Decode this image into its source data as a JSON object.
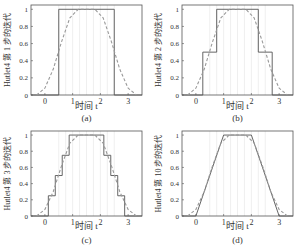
{
  "figure": {
    "background": "#ffffff",
    "axes_color": "#555555",
    "step_color": "#555555",
    "target_color": "#999999",
    "grid_color": "#e4e4e4"
  },
  "chart_data": [
    {
      "type": "line",
      "panel_label": "(a)",
      "xlabel": "时间 t",
      "ylabel": "Hutlet4 第 1 步的迭代",
      "xlim": [
        -0.5,
        3.5
      ],
      "ylim": [
        0,
        1.05
      ],
      "xticks": [
        0,
        1,
        2,
        3
      ],
      "yticks": [
        0,
        0.2,
        0.4,
        0.6,
        0.8,
        1
      ],
      "ytick_labels": [
        "0",
        "0.2",
        "0.4",
        "0.6",
        "0.8",
        "1"
      ],
      "series": [
        {
          "name": "Hutlet4 iteration",
          "style": "solid",
          "x": [
            -0.5,
            0.5,
            0.5,
            2.5,
            2.5,
            3.5
          ],
          "y": [
            0,
            0,
            1,
            1,
            0,
            0
          ]
        },
        {
          "name": "limit function",
          "style": "dashed",
          "x": [
            -0.3,
            0,
            0.3,
            0.6,
            0.9,
            1.2,
            1.5,
            1.8,
            2.1,
            2.4,
            2.7,
            3.0,
            3.3
          ],
          "y": [
            0,
            0.08,
            0.3,
            0.62,
            0.9,
            1.0,
            1.0,
            1.0,
            0.9,
            0.62,
            0.3,
            0.08,
            0
          ]
        }
      ]
    },
    {
      "type": "line",
      "panel_label": "(b)",
      "xlabel": "时间 t",
      "ylabel": "Hutlet4 第 2 步的迭代",
      "xlim": [
        -0.5,
        3.5
      ],
      "ylim": [
        0,
        1.05
      ],
      "xticks": [
        0,
        1,
        2,
        3
      ],
      "yticks": [
        0,
        0.2,
        0.4,
        0.6,
        0.8,
        1
      ],
      "ytick_labels": [
        "0",
        "0.2",
        "0.4",
        "0.6",
        "0.8",
        "1"
      ],
      "series": [
        {
          "name": "Hutlet4 iteration",
          "style": "solid",
          "x": [
            -0.5,
            0.25,
            0.25,
            0.75,
            0.75,
            2.25,
            2.25,
            2.75,
            2.75,
            3.5
          ],
          "y": [
            0,
            0,
            0.5,
            0.5,
            1,
            1,
            0.5,
            0.5,
            0,
            0
          ]
        },
        {
          "name": "limit function",
          "style": "dashed",
          "x": [
            -0.3,
            0,
            0.3,
            0.6,
            0.9,
            1.2,
            1.5,
            1.8,
            2.1,
            2.4,
            2.7,
            3.0,
            3.3
          ],
          "y": [
            0,
            0.08,
            0.3,
            0.62,
            0.9,
            1.0,
            1.0,
            1.0,
            0.9,
            0.62,
            0.3,
            0.08,
            0
          ]
        }
      ]
    },
    {
      "type": "line",
      "panel_label": "(c)",
      "xlabel": "时间 t",
      "ylabel": "Hutlet4 第 3 步的迭代",
      "xlim": [
        -0.5,
        3.5
      ],
      "ylim": [
        0,
        1.05
      ],
      "xticks": [
        0,
        1,
        2,
        3
      ],
      "yticks": [
        0,
        0.2,
        0.4,
        0.6,
        0.8,
        1
      ],
      "ytick_labels": [
        "0",
        "0.2",
        "0.4",
        "0.6",
        "0.8",
        "1"
      ],
      "series": [
        {
          "name": "Hutlet4 iteration",
          "style": "solid",
          "x": [
            -0.5,
            0.125,
            0.125,
            0.375,
            0.375,
            0.625,
            0.625,
            0.875,
            0.875,
            2.125,
            2.125,
            2.375,
            2.375,
            2.625,
            2.625,
            2.875,
            2.875,
            3.5
          ],
          "y": [
            0,
            0,
            0.25,
            0.25,
            0.5,
            0.5,
            0.75,
            0.75,
            1,
            1,
            0.75,
            0.75,
            0.5,
            0.5,
            0.25,
            0.25,
            0,
            0
          ]
        },
        {
          "name": "limit function",
          "style": "dashed",
          "x": [
            -0.3,
            0,
            0.3,
            0.6,
            0.9,
            1.2,
            1.5,
            1.8,
            2.1,
            2.4,
            2.7,
            3.0,
            3.3
          ],
          "y": [
            0,
            0.08,
            0.3,
            0.62,
            0.9,
            1.0,
            1.0,
            1.0,
            0.9,
            0.62,
            0.3,
            0.08,
            0
          ]
        }
      ]
    },
    {
      "type": "line",
      "panel_label": "(d)",
      "xlabel": "时间 t",
      "ylabel": "Hutlet4 第 10 步的迭代",
      "xlim": [
        -0.5,
        3.5
      ],
      "ylim": [
        0,
        1.05
      ],
      "xticks": [
        0,
        1,
        2,
        3
      ],
      "yticks": [
        0,
        0.2,
        0.4,
        0.6,
        0.8,
        1
      ],
      "ytick_labels": [
        "0",
        "0.2",
        "0.4",
        "0.6",
        "0.8",
        "1"
      ],
      "series": [
        {
          "name": "Hutlet4 iteration",
          "style": "solid",
          "x": [
            -0.5,
            0,
            1,
            2,
            3,
            3.5
          ],
          "y": [
            0,
            0,
            1,
            1,
            0,
            0
          ]
        },
        {
          "name": "limit function",
          "style": "dashed",
          "x": [
            -0.3,
            0,
            0.3,
            0.6,
            0.9,
            1.2,
            1.5,
            1.8,
            2.1,
            2.4,
            2.7,
            3.0,
            3.3
          ],
          "y": [
            0,
            0.08,
            0.3,
            0.62,
            0.9,
            1.0,
            1.0,
            1.0,
            0.9,
            0.62,
            0.3,
            0.08,
            0
          ]
        }
      ]
    }
  ]
}
